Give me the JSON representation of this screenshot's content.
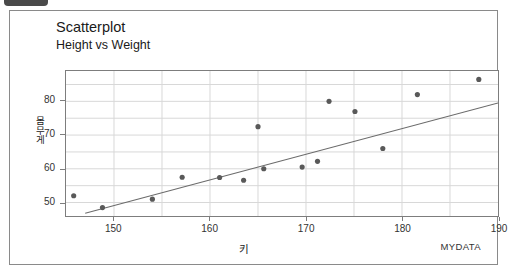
{
  "window": {
    "corner_tab_label": ""
  },
  "chart_header": {
    "title": "Scatterplot",
    "subtitle": "Height vs Weight"
  },
  "watermark": "MYDATA",
  "chart_data": {
    "type": "scatter",
    "title": "Scatterplot",
    "subtitle": "Height vs Weight",
    "xlabel": "키",
    "ylabel": "몸무게",
    "xlim": [
      145,
      190
    ],
    "ylim": [
      46,
      89
    ],
    "xticks": [
      150,
      160,
      170,
      180,
      190
    ],
    "yticks": [
      50,
      60,
      70,
      80
    ],
    "grid": true,
    "legend": false,
    "marker_color": "#595959",
    "line_color": "#6b6b6b",
    "grid_color": "#d8d8d8",
    "axis_color": "#7d7d7d",
    "points": [
      {
        "x": 145.8,
        "y": 52.0
      },
      {
        "x": 148.8,
        "y": 48.5
      },
      {
        "x": 154.0,
        "y": 51.0
      },
      {
        "x": 157.1,
        "y": 57.5
      },
      {
        "x": 161.0,
        "y": 57.4
      },
      {
        "x": 163.5,
        "y": 56.6
      },
      {
        "x": 165.0,
        "y": 72.5
      },
      {
        "x": 165.6,
        "y": 60.0
      },
      {
        "x": 169.6,
        "y": 60.5
      },
      {
        "x": 171.2,
        "y": 62.2
      },
      {
        "x": 172.4,
        "y": 80.0
      },
      {
        "x": 175.1,
        "y": 77.0
      },
      {
        "x": 178.0,
        "y": 66.0
      },
      {
        "x": 181.6,
        "y": 82.0
      },
      {
        "x": 188.0,
        "y": 86.5
      }
    ],
    "fit_line": {
      "name": "regression-line",
      "x_start": 147.0,
      "y_start": 46.8,
      "x_end": 190.0,
      "y_end": 79.5
    }
  }
}
